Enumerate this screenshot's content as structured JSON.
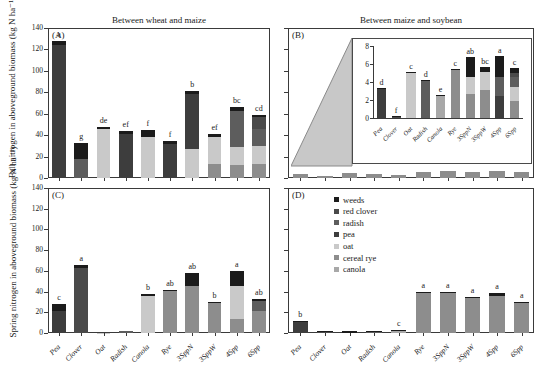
{
  "figure": {
    "yaxis_label_top": "Fall nitrogen in aboveground biomass  (kg N ha⁻¹)",
    "yaxis_label_bottom": "Spring nitrogen in aboveground biomass  (kg N ha⁻¹)"
  },
  "legend": {
    "position": "panel-D-top-left",
    "items": [
      {
        "label": "weeds",
        "color": "#1b1b1b"
      },
      {
        "label": "red clover",
        "color": "#4a4a4a"
      },
      {
        "label": "radish",
        "color": "#5d5d5d"
      },
      {
        "label": "pea",
        "color": "#3d3d3d"
      },
      {
        "label": "oat",
        "color": "#c9c9c9"
      },
      {
        "label": "cereal rye",
        "color": "#8d8d8d"
      },
      {
        "label": "canola",
        "color": "#a8a8a8"
      }
    ]
  },
  "colors": {
    "weeds": "#1b1b1b",
    "red_clover": "#4a4a4a",
    "radish": "#5d5d5d",
    "pea": "#3d3d3d",
    "oat": "#c9c9c9",
    "cereal_rye": "#8d8d8d",
    "canola": "#a8a8a8",
    "axis": "#3a3a3a",
    "cone_fill": "#c8c8c8"
  },
  "chart_data": [
    {
      "id": "A",
      "type": "bar",
      "stacked": true,
      "panel_tag": "(A)",
      "title": "Between wheat and maize",
      "xlabel": "",
      "ylabel": "Fall nitrogen in aboveground biomass  (kg N ha⁻¹)",
      "ylim": [
        0,
        140
      ],
      "yticks": [
        0,
        20,
        40,
        60,
        80,
        100,
        120,
        140
      ],
      "grid": false,
      "categories": [
        "Pea",
        "Clover",
        "Oat",
        "Radish",
        "Canola",
        "Rye",
        "3SppN",
        "3SppW",
        "4Spp",
        "6Spp"
      ],
      "series": [
        {
          "name": "canola",
          "values": [
            0,
            0,
            0,
            0,
            0,
            0,
            0,
            0,
            0,
            0
          ]
        },
        {
          "name": "cereal rye",
          "values": [
            0,
            0,
            0,
            0,
            0,
            0,
            0,
            13,
            12,
            13
          ]
        },
        {
          "name": "oat",
          "values": [
            0,
            0,
            46,
            0,
            38,
            0,
            27,
            25,
            17,
            17
          ]
        },
        {
          "name": "pea",
          "values": [
            124,
            0,
            0,
            41,
            0,
            32,
            51,
            0,
            0,
            0
          ]
        },
        {
          "name": "radish",
          "values": [
            0,
            18,
            0,
            0,
            0,
            0,
            0,
            0,
            34,
            16
          ]
        },
        {
          "name": "red clover",
          "values": [
            0,
            0,
            0,
            0,
            0,
            0,
            0,
            0,
            0,
            11
          ]
        },
        {
          "name": "weeds",
          "values": [
            4,
            15,
            2,
            3,
            7,
            3,
            3,
            3,
            3,
            2
          ]
        }
      ],
      "totals": [
        128,
        33,
        48,
        44,
        45,
        35,
        81,
        41,
        66,
        59
      ],
      "sig_letters": [
        "a",
        "g",
        "de",
        "ef",
        "f",
        "f",
        "b",
        "ef",
        "bc",
        "cd"
      ]
    },
    {
      "id": "B",
      "type": "bar",
      "stacked": true,
      "panel_tag": "(B)",
      "title": "Between maize and soybean",
      "xlabel": "",
      "ylabel": "",
      "ylim": [
        0,
        140
      ],
      "yticks": [
        0,
        20,
        40,
        60,
        80,
        100,
        120,
        140
      ],
      "grid": false,
      "categories": [
        "Pea",
        "Clover",
        "Oat",
        "Radish",
        "Canola",
        "Rye",
        "3SppN",
        "3SppW",
        "4Spp",
        "6Spp"
      ],
      "totals": [
        3.3,
        0.2,
        5.1,
        4.2,
        2.6,
        5.4,
        6.8,
        5.7,
        6.9,
        5.6
      ],
      "inset": {
        "ylim": [
          0,
          8
        ],
        "yticks": [
          0,
          2,
          4,
          6,
          8
        ],
        "categories": [
          "Pea",
          "Clover",
          "Oat",
          "Radish",
          "Canola",
          "Rye",
          "3SppN",
          "3SppW",
          "4Spp",
          "6Spp"
        ],
        "series": [
          {
            "name": "canola",
            "values": [
              0,
              0,
              0,
              0,
              2.5,
              0,
              0,
              0,
              0,
              0
            ]
          },
          {
            "name": "cereal rye",
            "values": [
              0,
              0,
              0,
              0,
              0,
              5.3,
              2.7,
              3.1,
              0,
              1.9
            ]
          },
          {
            "name": "oat",
            "values": [
              0,
              0,
              5.0,
              0,
              0,
              0,
              1.9,
              2.0,
              0,
              1.5
            ]
          },
          {
            "name": "pea",
            "values": [
              3.2,
              0,
              0,
              0,
              0,
              0,
              0,
              0,
              2.4,
              0
            ]
          },
          {
            "name": "radish",
            "values": [
              0,
              0,
              0,
              4.1,
              0,
              0,
              0,
              0,
              2.2,
              1.2
            ]
          },
          {
            "name": "red clover",
            "values": [
              0,
              0.1,
              0,
              0,
              0,
              0,
              0,
              0,
              0,
              0.4
            ]
          },
          {
            "name": "weeds",
            "values": [
              0.1,
              0.1,
              0.1,
              0.1,
              0.1,
              0.1,
              2.2,
              0.6,
              2.3,
              0.6
            ]
          }
        ],
        "totals": [
          3.3,
          0.2,
          5.1,
          4.2,
          2.6,
          5.4,
          6.8,
          5.7,
          6.9,
          5.6
        ],
        "sig_letters": [
          "d",
          "f",
          "c",
          "d",
          "e",
          "c",
          "ab",
          "bc",
          "a",
          "c"
        ]
      }
    },
    {
      "id": "C",
      "type": "bar",
      "stacked": true,
      "panel_tag": "(C)",
      "title": "",
      "xlabel": "",
      "ylabel": "Spring nitrogen in aboveground biomass  (kg N ha⁻¹)",
      "ylim": [
        0,
        140
      ],
      "yticks": [
        0,
        20,
        40,
        60,
        80,
        100,
        120,
        140
      ],
      "grid": false,
      "categories": [
        "Pea",
        "Clover",
        "Oat",
        "Radish",
        "Canola",
        "Rye",
        "3SppN",
        "3SppW",
        "4Spp",
        "6Spp"
      ],
      "series": [
        {
          "name": "canola",
          "values": [
            0,
            0,
            0,
            0,
            0,
            0,
            0,
            0,
            0,
            0
          ]
        },
        {
          "name": "cereal rye",
          "values": [
            0,
            0,
            0,
            0,
            0,
            41,
            45,
            29,
            14,
            21
          ]
        },
        {
          "name": "oat",
          "values": [
            0,
            0,
            0.3,
            0,
            36,
            0,
            0,
            0,
            31,
            0
          ]
        },
        {
          "name": "pea",
          "values": [
            21,
            0,
            0,
            0,
            0,
            0,
            0,
            0,
            0,
            0
          ]
        },
        {
          "name": "radish",
          "values": [
            0,
            0,
            0,
            1.6,
            0,
            0,
            0,
            0,
            0,
            10
          ]
        },
        {
          "name": "red clover",
          "values": [
            0,
            63,
            0,
            0,
            0,
            0,
            0,
            0,
            0,
            0
          ]
        },
        {
          "name": "weeds",
          "values": [
            7,
            3,
            0.2,
            0.5,
            2,
            1,
            13,
            1,
            15,
            2
          ]
        }
      ],
      "totals": [
        28,
        66,
        0.5,
        2.1,
        38,
        42,
        58,
        30,
        60,
        33
      ],
      "sig_letters": [
        "c",
        "a",
        "",
        "",
        "b",
        "ab",
        "ab",
        "b",
        "a",
        "ab"
      ]
    },
    {
      "id": "D",
      "type": "bar",
      "stacked": true,
      "panel_tag": "(D)",
      "title": "",
      "xlabel": "",
      "ylabel": "",
      "ylim": [
        0,
        140
      ],
      "yticks": [
        0,
        20,
        40,
        60,
        80,
        100,
        120,
        140
      ],
      "grid": false,
      "categories": [
        "Pea",
        "Clover",
        "Oat",
        "Radish",
        "Canola",
        "Rye",
        "3SppN",
        "3SppW",
        "4Spp",
        "6Spp"
      ],
      "series": [
        {
          "name": "canola",
          "values": [
            0,
            0,
            0,
            0,
            2,
            0,
            0,
            0,
            0,
            0
          ]
        },
        {
          "name": "cereal rye",
          "values": [
            0,
            0,
            0,
            0,
            0,
            39,
            39,
            34,
            36,
            29
          ]
        },
        {
          "name": "oat",
          "values": [
            0,
            0,
            0,
            0,
            0,
            0,
            0,
            0,
            0,
            0
          ]
        },
        {
          "name": "pea",
          "values": [
            11,
            0,
            0,
            0,
            0,
            0,
            0,
            0,
            0,
            0
          ]
        },
        {
          "name": "radish",
          "values": [
            0,
            0,
            0,
            0.8,
            0,
            0,
            0,
            0,
            0,
            0
          ]
        },
        {
          "name": "red clover",
          "values": [
            0,
            0.7,
            0,
            0,
            0,
            0,
            0,
            0,
            0,
            0
          ]
        },
        {
          "name": "weeds",
          "values": [
            1,
            0.8,
            1.6,
            0.7,
            1.2,
            0.6,
            0.6,
            0.6,
            2.4,
            0.6
          ]
        }
      ],
      "totals": [
        12,
        1.5,
        1.6,
        1.5,
        3.2,
        39.6,
        39.6,
        34.6,
        38.4,
        29.6
      ],
      "sig_letters": [
        "b",
        "",
        "",
        "",
        "c",
        "a",
        "a",
        "a",
        "a",
        "a"
      ]
    }
  ]
}
